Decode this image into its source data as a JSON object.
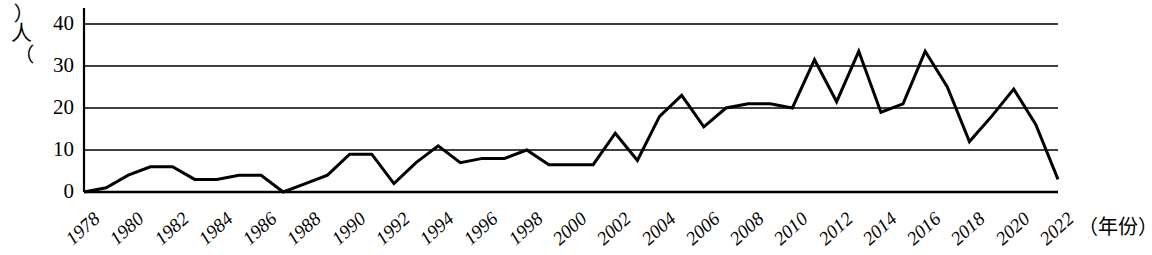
{
  "chart_data": {
    "type": "line",
    "title": "",
    "xlabel": "（年份）",
    "ylabel": "（人）",
    "ylim": [
      0,
      40
    ],
    "yticks": [
      0,
      10,
      20,
      30,
      40
    ],
    "xlim": [
      1978,
      2022
    ],
    "xticks": [
      1978,
      1980,
      1982,
      1984,
      1986,
      1988,
      1990,
      1992,
      1994,
      1996,
      1998,
      2000,
      2002,
      2004,
      2006,
      2008,
      2010,
      2012,
      2014,
      2016,
      2018,
      2020,
      2022
    ],
    "grid": "horizontal",
    "legend": "none",
    "line_color": "#000000",
    "x": [
      1978,
      1979,
      1980,
      1981,
      1982,
      1983,
      1984,
      1985,
      1986,
      1987,
      1988,
      1989,
      1990,
      1991,
      1992,
      1993,
      1994,
      1995,
      1996,
      1997,
      1998,
      1999,
      2000,
      2001,
      2002,
      2003,
      2004,
      2005,
      2006,
      2007,
      2008,
      2009,
      2010,
      2011,
      2012,
      2013,
      2014,
      2015,
      2016,
      2017,
      2018,
      2019,
      2020,
      2021,
      2022
    ],
    "values": [
      0,
      1,
      4,
      6,
      6,
      3,
      3,
      4,
      4,
      0,
      2,
      4,
      9,
      9,
      2,
      7,
      11,
      7,
      8,
      8,
      10,
      6.5,
      6.5,
      6.5,
      14,
      7.5,
      18,
      23,
      15.5,
      20,
      21,
      21,
      20,
      31.5,
      21.5,
      33.5,
      19,
      21,
      33.5,
      25,
      12,
      18,
      24.5,
      16,
      3
    ],
    "categories": [
      "1978",
      "1979",
      "1980",
      "1981",
      "1982",
      "1983",
      "1984",
      "1985",
      "1986",
      "1987",
      "1988",
      "1989",
      "1990",
      "1991",
      "1992",
      "1993",
      "1994",
      "1995",
      "1996",
      "1997",
      "1998",
      "1999",
      "2000",
      "2001",
      "2002",
      "2003",
      "2004",
      "2005",
      "2006",
      "2007",
      "2008",
      "2009",
      "2010",
      "2011",
      "2012",
      "2013",
      "2014",
      "2015",
      "2016",
      "2017",
      "2018",
      "2019",
      "2020",
      "2021",
      "2022"
    ]
  },
  "axis": {
    "y_unit_paren_open": "︵",
    "y_unit_glyph": "人",
    "y_unit_paren_close": "︶",
    "x_title": "（年份）"
  }
}
